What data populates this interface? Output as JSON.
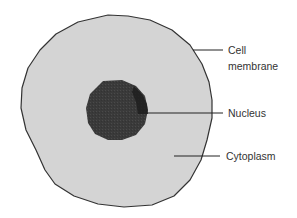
{
  "diagram": {
    "type": "cell-structure",
    "colors": {
      "background": "#ffffff",
      "cytoplasm": "#d4d4d4",
      "membrane_outline": "#333333",
      "nucleus": "#3c3c3c",
      "nucleus_shadow": "#1e1e1e",
      "leader_line": "#222222",
      "label_text": "#333333"
    },
    "labels": {
      "membrane_line1": "Cell",
      "membrane_line2": "membrane",
      "nucleus": "Nucleus",
      "cytoplasm": "Cytoplasm"
    }
  }
}
